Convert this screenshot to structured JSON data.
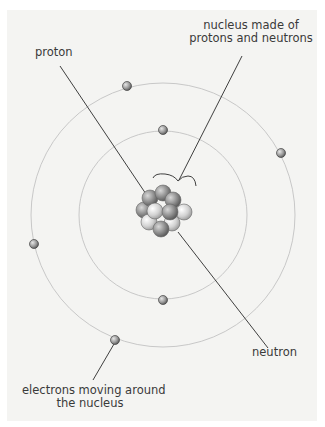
{
  "diagram": {
    "labels": {
      "proton": "proton",
      "nucleus_line1": "nucleus made of",
      "nucleus_line2": "protons and neutrons",
      "neutron": "neutron",
      "electrons_line1": "electrons moving around",
      "electrons_line2": "the nucleus"
    },
    "colors": {
      "background": "#f4f4f2",
      "orbit": "#c8c8c8",
      "leader_line": "#2a2a2a",
      "proton": "#8a8a8a",
      "neutron": "#d4d4d4",
      "electron": "#9a9a9a",
      "text": "#3a3a3a"
    }
  }
}
